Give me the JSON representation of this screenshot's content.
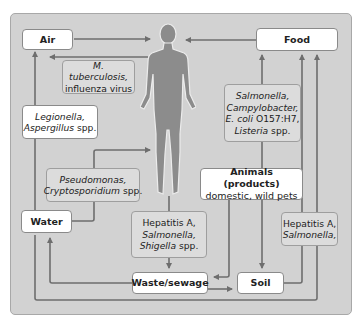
{
  "colors": {
    "panel": "#d2d2d2",
    "node_box": "#ffffff",
    "pathogen_box": "#dcdcdc",
    "arrow": "#6e6e6e",
    "human": "#8c8c8c"
  },
  "nodes": {
    "air": "Air",
    "food": "Food",
    "water": "Water",
    "waste": "Waste/sewage",
    "soil": "Soil",
    "animals_title": "Animals (products)",
    "animals_sub": "domestic, wild pets"
  },
  "human_icon": "human-body-icon",
  "pathogens": {
    "air_to_human": {
      "l1_it": "M. tuberculosis,",
      "l2": "influenza virus"
    },
    "water_to_air": {
      "l1_it": "Legionella,",
      "l2_it": "Aspergillus",
      "l2": " spp."
    },
    "water_to_human": {
      "l1_it": "Pseudomonas,",
      "l2_it": "Cryptosporidium",
      "l2": " spp."
    },
    "food_to_human": {
      "l1_it": "Salmonella,",
      "l2_it": "Campylobacter,",
      "l3_it": "E. coli",
      "l3": " O157:H7,",
      "l4_it": "Listeria",
      "l4": " spp."
    },
    "human_to_waste": {
      "l1": "Hepatitis A,",
      "l2_it": "Salmonella,",
      "l3_it": "Shigella",
      "l3": " spp."
    },
    "soil_to_food": {
      "l1": "Hepatitis A,",
      "l2_it": "Salmonella,"
    }
  }
}
